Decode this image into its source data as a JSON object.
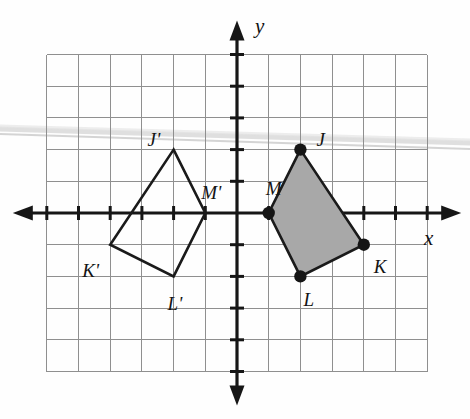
{
  "figure": {
    "type": "coordinate-plane-geometry"
  },
  "axes": {
    "x_label": "x",
    "y_label": "y",
    "origin_px": [
      237,
      213
    ],
    "unit_px": 31.7,
    "x_range": [
      -6,
      6
    ],
    "y_range": [
      -5,
      5
    ],
    "grid_visible": true,
    "grid_color": "#8f8f8f",
    "axis_color": "#161616",
    "tick_marks": true
  },
  "colors": {
    "grid_line": "#8f8f8f",
    "axis": "#161616",
    "shape_stroke": "#1a1a1a",
    "shape_fill": "#a8a8a8",
    "vertex_dot": "#151515",
    "label_text": "#131313",
    "page_background": "#fefefe",
    "scan_streak": "#d6d6d6"
  },
  "shapes": [
    {
      "name": "quadrilateral-JKLM",
      "filled": true,
      "fill": "#a8a8a8",
      "vertices_shown": true,
      "points": [
        {
          "label": "J",
          "x": 2,
          "y": 2,
          "label_dx": 16,
          "label_dy": -20
        },
        {
          "label": "K",
          "x": 4,
          "y": -1,
          "label_dx": 10,
          "label_dy": 12
        },
        {
          "label": "L",
          "x": 2,
          "y": -2,
          "label_dx": 3,
          "label_dy": 14
        },
        {
          "label": "M",
          "x": 1,
          "y": 0,
          "label_dx": -3,
          "label_dy": -34
        }
      ]
    },
    {
      "name": "quadrilateral-J-prime-K-prime-L-prime-M-prime",
      "filled": false,
      "fill": "none",
      "vertices_shown": false,
      "points": [
        {
          "label": "J'",
          "x": -2,
          "y": 2,
          "label_dx": -26,
          "label_dy": -20
        },
        {
          "label": "K'",
          "x": -4,
          "y": -1,
          "label_dx": -28,
          "label_dy": 16
        },
        {
          "label": "L'",
          "x": -2,
          "y": -2,
          "label_dx": -6,
          "label_dy": 18
        },
        {
          "label": "M'",
          "x": -1,
          "y": 0,
          "label_dx": -4,
          "label_dy": -30
        }
      ]
    }
  ],
  "transformation": {
    "kind": "reflection",
    "line_of_reflection": "y-axis"
  },
  "axis_labels": {
    "x": {
      "text": "x",
      "left": 424,
      "top": 228
    },
    "y": {
      "text": "y",
      "left": 255,
      "top": 16
    }
  }
}
